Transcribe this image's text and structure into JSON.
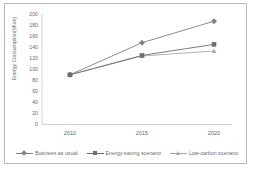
{
  "chart_data": {
    "type": "line",
    "title": "",
    "xlabel": "",
    "ylabel": "Energy Consumption(Mtce)",
    "categories": [
      "2010",
      "2015",
      "2020"
    ],
    "x": [
      2010,
      2015,
      2020
    ],
    "xlim": [
      2010,
      2020
    ],
    "ylim": [
      0,
      200
    ],
    "yticks": [
      0,
      20,
      40,
      60,
      80,
      100,
      120,
      140,
      160,
      180,
      200
    ],
    "ytick_labels": [
      "0",
      "20",
      "40",
      "60",
      "80",
      "100",
      "120",
      "140",
      "160",
      "180",
      "200"
    ],
    "grid": false,
    "legend_position": "bottom",
    "series": [
      {
        "name": "Business as usual",
        "values": [
          90,
          148,
          187
        ],
        "marker": "diamond",
        "color": "#808083"
      },
      {
        "name": "Energy-saving scenario",
        "values": [
          90,
          125,
          145
        ],
        "marker": "square",
        "color": "#6e6e71"
      },
      {
        "name": "Low-carbon scenario",
        "values": [
          90,
          124,
          133
        ],
        "marker": "triangle",
        "color": "#a9a9ad"
      }
    ]
  },
  "axis": {
    "y_title": "Energy Consumption(Mtce)",
    "y_ticks": [
      "200",
      "180",
      "160",
      "140",
      "120",
      "100",
      "80",
      "60",
      "40",
      "20",
      "0"
    ],
    "x_ticks": [
      "2010",
      "2015",
      "2020"
    ]
  },
  "legend": {
    "items": [
      {
        "label": "Business as usual"
      },
      {
        "label": "Energy-saving scenario"
      },
      {
        "label": "Low-carbon scenario"
      }
    ]
  },
  "style": {
    "series1_color": "#808083",
    "series2_color": "#6e6e71",
    "series3_color": "#a9a9ad",
    "axis_color": "#c8c8cb",
    "text_color": "#6a6a6c",
    "border_color": "#b9b9bb"
  }
}
